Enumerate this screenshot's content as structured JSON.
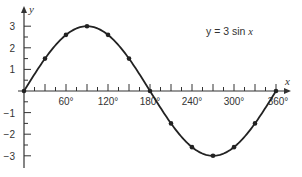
{
  "chart_data": {
    "type": "line",
    "title": "",
    "annotation": "y = 3 sin x",
    "xlabel": "x",
    "ylabel": "y",
    "x_unit": "degrees",
    "xlim": [
      0,
      360
    ],
    "ylim": [
      -3.5,
      3.5
    ],
    "x_tick_labels": [
      "60°",
      "120°",
      "180°",
      "240°",
      "300°",
      "360°"
    ],
    "x_tick_values": [
      60,
      120,
      180,
      240,
      300,
      360
    ],
    "x_minor_tick_step": 15,
    "y_tick_labels": [
      "3",
      "2",
      "1",
      "−1",
      "−2",
      "−3"
    ],
    "y_tick_values": [
      3,
      2,
      1,
      -1,
      -2,
      -3
    ],
    "grid": false,
    "legend": "none",
    "series": [
      {
        "name": "y = 3 sin x",
        "x": [
          0,
          30,
          60,
          90,
          120,
          150,
          180,
          210,
          240,
          270,
          300,
          330,
          360
        ],
        "values": [
          0,
          1.5,
          2.6,
          3,
          2.6,
          1.5,
          0,
          -1.5,
          -2.6,
          -3,
          -2.6,
          -1.5,
          0
        ],
        "color": "#222222",
        "markers": true
      }
    ]
  },
  "labels": {
    "equation_prefix": "y = 3 sin ",
    "equation_var": "x",
    "x_axis": "x",
    "y_axis": "y"
  }
}
